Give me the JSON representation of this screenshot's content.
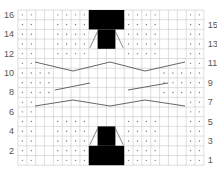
{
  "chart_data": {
    "type": "table",
    "title": "",
    "columns": 21,
    "rows": 16,
    "row_labels_left": [
      "16",
      "14",
      "12",
      "10",
      "8",
      "6",
      "4",
      "2"
    ],
    "row_labels_right": [
      "15",
      "13",
      "11",
      "9",
      "7",
      "5",
      "3",
      "1"
    ],
    "colors": {
      "grid": "#c8c8c8",
      "dot": "#777777",
      "block": "#000000",
      "line": "#555555",
      "label": "#555555"
    },
    "dot_rows": {
      "edge_only": {
        "rows": [
          5,
          4,
          3,
          2,
          1,
          12,
          13,
          14,
          15,
          16
        ],
        "cols": [
          1,
          2,
          5,
          6,
          7,
          8,
          13,
          14,
          15,
          16,
          20,
          21
        ]
      },
      "middle": {
        "rows": [
          8,
          9,
          10
        ],
        "cols": [
          1,
          2,
          3,
          4,
          17,
          18,
          19,
          20,
          21
        ]
      },
      "cable_rows": {
        "rows": [
          6,
          7,
          11
        ],
        "cols": [
          1,
          2,
          20,
          21
        ]
      }
    },
    "blocks": [
      {
        "rows": [
          15,
          16
        ],
        "cols": [
          9,
          12
        ]
      },
      {
        "rows": [
          13,
          14
        ],
        "cols": [
          10,
          11
        ]
      },
      {
        "rows": [
          3,
          4
        ],
        "cols": [
          10,
          11
        ]
      },
      {
        "rows": [
          1,
          2
        ],
        "cols": [
          9,
          12
        ]
      }
    ],
    "cable_lines": [
      {
        "name": "upper-zigzag",
        "points": [
          [
            35,
            62
          ],
          [
            73,
            71
          ],
          [
            110,
            62
          ],
          [
            145,
            71
          ],
          [
            185,
            62
          ]
        ]
      },
      {
        "name": "middle-left",
        "points": [
          [
            55,
            90
          ],
          [
            90,
            83
          ]
        ]
      },
      {
        "name": "middle-right",
        "points": [
          [
            128,
            90
          ],
          [
            168,
            83
          ]
        ]
      },
      {
        "name": "lower-zigzag",
        "points": [
          [
            35,
            106
          ],
          [
            73,
            100
          ],
          [
            110,
            106
          ],
          [
            145,
            100
          ],
          [
            185,
            106
          ]
        ]
      }
    ]
  }
}
